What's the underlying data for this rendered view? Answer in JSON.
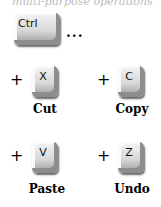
{
  "header": {
    "partial_text": "multi-purpose operations"
  },
  "modifier": {
    "key": "Ctrl",
    "ellipsis": "..."
  },
  "shortcuts": [
    {
      "plus": "+",
      "key": "X",
      "label": "Cut"
    },
    {
      "plus": "+",
      "key": "C",
      "label": "Copy"
    },
    {
      "plus": "+",
      "key": "V",
      "label": "Paste"
    },
    {
      "plus": "+",
      "key": "Z",
      "label": "Undo"
    }
  ]
}
